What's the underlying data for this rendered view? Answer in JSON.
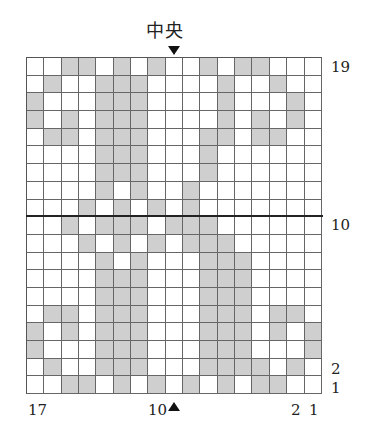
{
  "title": "中央",
  "grid": {
    "cols": 17,
    "rows": 19,
    "shaded_color": "#cfcfcf",
    "rows_data": [
      {
        "row": 19,
        "shaded": [
          3,
          4,
          6,
          8,
          11,
          13,
          14
        ]
      },
      {
        "row": 18,
        "shaded": [
          2,
          5,
          6,
          7,
          12,
          15
        ]
      },
      {
        "row": 17,
        "shaded": [
          1,
          5,
          6,
          7,
          12,
          16
        ]
      },
      {
        "row": 16,
        "shaded": [
          1,
          3,
          5,
          6,
          7,
          12,
          14,
          16
        ]
      },
      {
        "row": 15,
        "shaded": [
          2,
          3,
          5,
          6,
          7,
          11,
          12,
          14,
          15
        ]
      },
      {
        "row": 14,
        "shaded": [
          5,
          6,
          7,
          11
        ]
      },
      {
        "row": 13,
        "shaded": [
          5,
          6,
          7,
          11
        ]
      },
      {
        "row": 12,
        "shaded": [
          5,
          7,
          10
        ]
      },
      {
        "row": 11,
        "shaded": [
          4,
          6,
          8,
          10
        ]
      },
      {
        "row": 10,
        "shaded": [
          3,
          5,
          6,
          7,
          9,
          10,
          11
        ]
      },
      {
        "row": 9,
        "shaded": [
          4,
          6,
          8,
          10,
          11,
          12
        ]
      },
      {
        "row": 8,
        "shaded": [
          5,
          7,
          11,
          12,
          13
        ]
      },
      {
        "row": 7,
        "shaded": [
          5,
          6,
          7,
          11,
          12,
          13
        ]
      },
      {
        "row": 6,
        "shaded": [
          5,
          6,
          7,
          11,
          12,
          13
        ]
      },
      {
        "row": 5,
        "shaded": [
          2,
          3,
          5,
          6,
          7,
          11,
          12,
          13,
          15,
          16
        ]
      },
      {
        "row": 4,
        "shaded": [
          1,
          3,
          5,
          6,
          7,
          11,
          12,
          13,
          15,
          17
        ]
      },
      {
        "row": 3,
        "shaded": [
          1,
          5,
          6,
          7,
          11,
          12,
          13,
          17
        ]
      },
      {
        "row": 2,
        "shaded": [
          2,
          5,
          6,
          7,
          11,
          12,
          13,
          14,
          16
        ]
      },
      {
        "row": 1,
        "shaded": [
          3,
          4,
          6,
          8,
          10,
          12,
          14,
          15
        ]
      }
    ]
  },
  "row_labels": {
    "r19": "19",
    "r10": "10",
    "r2": "2",
    "r1": "1"
  },
  "col_labels": {
    "c17": "17",
    "c10": "10",
    "c2": "2",
    "c1": "1"
  }
}
